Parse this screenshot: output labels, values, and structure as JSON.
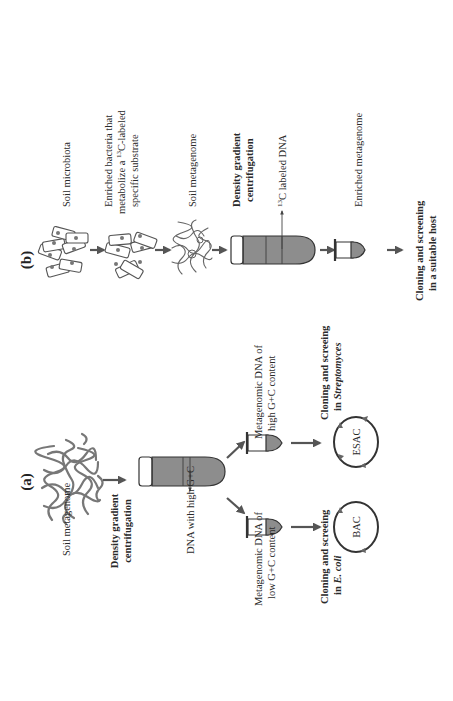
{
  "figure": {
    "orientation": "rotated 90 degrees counter-clockwise",
    "panels": [
      {
        "id": "a",
        "label": "(a)",
        "steps": {
          "start": "Soil metagenome",
          "process": [
            "Density gradient",
            "centrifugation"
          ],
          "tube_band_label": "DNA with high G+C",
          "branch_high": {
            "fraction_label": [
              "Metagenomic DNA of",
              "high G+C content"
            ],
            "vector": "ESAC",
            "cloning_label": [
              "Cloning and screeing",
              "in "
            ],
            "host": "Streptomyces"
          },
          "branch_low": {
            "fraction_label": [
              "Metagenomic DNA of",
              "low G+C content"
            ],
            "vector": "BAC",
            "cloning_label": [
              "Cloning and screeing",
              "in "
            ],
            "host": "E. coli"
          }
        }
      },
      {
        "id": "b",
        "label": "(b)",
        "steps": {
          "start": "Soil microbiota",
          "enrichment": [
            "Enriched bacteria that",
            "metabolize a ",
            "13",
            "C-labeled",
            "specific substrate"
          ],
          "metagenome": "Soil metagenome",
          "process": [
            "Density gradient",
            "centrifugation"
          ],
          "tube_band_label_sup": "13",
          "tube_band_label": "C labeled DNA",
          "enriched": "Enriched metagenome",
          "final": [
            "Cloning and screening",
            "in a suitable host"
          ]
        }
      }
    ],
    "colors": {
      "arrow": "#555555",
      "tube_fill": "#8d8d8d",
      "text": "#2a2a2a",
      "background": "#ffffff"
    }
  }
}
